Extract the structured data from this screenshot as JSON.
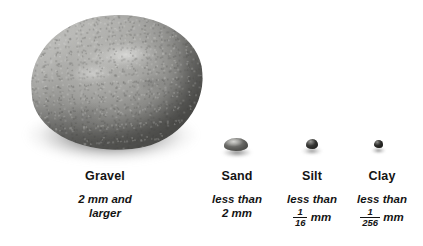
{
  "figure": {
    "background_color": "#ffffff",
    "text_color": "#141414"
  },
  "categories": [
    {
      "id": "gravel",
      "name": "Gravel",
      "size_line1": "2 mm and",
      "size_line2": "larger",
      "specimen": "large-rock-image",
      "fraction": null
    },
    {
      "id": "sand",
      "name": "Sand",
      "size_line1": "less than",
      "size_line2": "2 mm",
      "specimen": "sand-grain-image",
      "fraction": null
    },
    {
      "id": "silt",
      "name": "Silt",
      "size_line1": "less than",
      "size_line2": "",
      "specimen": "silt-grain-image",
      "fraction": {
        "numerator": "1",
        "denominator": "16",
        "unit": "mm"
      }
    },
    {
      "id": "clay",
      "name": "Clay",
      "size_line1": "less than",
      "size_line2": "",
      "specimen": "clay-grain-image",
      "fraction": {
        "numerator": "1",
        "denominator": "256",
        "unit": "mm"
      }
    }
  ]
}
